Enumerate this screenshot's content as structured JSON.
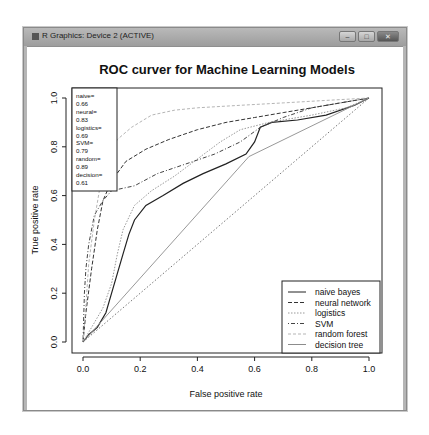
{
  "window": {
    "title": "R Graphics: Device 2 (ACTIVE)",
    "controls": {
      "minimize": "–",
      "maximize": "□",
      "close": "✕"
    }
  },
  "chart_data": {
    "type": "line",
    "title": "ROC curver for Machine Learning Models",
    "xlabel": "False positive rate",
    "ylabel": "True positive rate",
    "xlim": [
      0,
      1
    ],
    "ylim": [
      0,
      1
    ],
    "x_ticks": [
      "0.0",
      "0.2",
      "0.4",
      "0.6",
      "0.8",
      "1.0"
    ],
    "y_ticks": [
      "0.0",
      "0.2",
      "0.4",
      "0.6",
      "0.8",
      "1.0"
    ],
    "grid": false,
    "auc_box": {
      "lines": [
        "naive=",
        "0.66",
        "neural=",
        "0.83",
        "logistics=",
        "0.69",
        "SVM=",
        "0.79",
        "random=",
        "0.89",
        "decision=",
        "0.61"
      ]
    },
    "legend_position": "bottomright",
    "series": [
      {
        "name": "naive bayes",
        "auc": 0.66,
        "style": "solid",
        "color": "#222222",
        "width": 1.2,
        "points": [
          [
            0,
            0
          ],
          [
            0.02,
            0.03
          ],
          [
            0.05,
            0.06
          ],
          [
            0.08,
            0.12
          ],
          [
            0.1,
            0.2
          ],
          [
            0.12,
            0.28
          ],
          [
            0.14,
            0.36
          ],
          [
            0.16,
            0.44
          ],
          [
            0.18,
            0.5
          ],
          [
            0.22,
            0.56
          ],
          [
            0.28,
            0.6
          ],
          [
            0.35,
            0.65
          ],
          [
            0.42,
            0.69
          ],
          [
            0.5,
            0.73
          ],
          [
            0.57,
            0.77
          ],
          [
            0.6,
            0.82
          ],
          [
            0.62,
            0.88
          ],
          [
            0.66,
            0.9
          ],
          [
            0.75,
            0.91
          ],
          [
            0.85,
            0.93
          ],
          [
            0.95,
            0.97
          ],
          [
            1,
            1
          ]
        ]
      },
      {
        "name": "neural network",
        "auc": 0.83,
        "style": "dashed",
        "color": "#333333",
        "width": 1,
        "points": [
          [
            0,
            0
          ],
          [
            0.01,
            0.12
          ],
          [
            0.03,
            0.3
          ],
          [
            0.05,
            0.46
          ],
          [
            0.07,
            0.58
          ],
          [
            0.1,
            0.66
          ],
          [
            0.15,
            0.74
          ],
          [
            0.22,
            0.79
          ],
          [
            0.3,
            0.83
          ],
          [
            0.4,
            0.87
          ],
          [
            0.5,
            0.9
          ],
          [
            0.6,
            0.92
          ],
          [
            0.7,
            0.94
          ],
          [
            0.8,
            0.96
          ],
          [
            0.9,
            0.98
          ],
          [
            1,
            1
          ]
        ]
      },
      {
        "name": "logistics",
        "auc": 0.69,
        "style": "dotted",
        "color": "#999999",
        "width": 1,
        "points": [
          [
            0,
            0
          ],
          [
            0.03,
            0.06
          ],
          [
            0.07,
            0.14
          ],
          [
            0.1,
            0.24
          ],
          [
            0.12,
            0.36
          ],
          [
            0.14,
            0.46
          ],
          [
            0.18,
            0.56
          ],
          [
            0.24,
            0.62
          ],
          [
            0.32,
            0.68
          ],
          [
            0.4,
            0.75
          ],
          [
            0.48,
            0.82
          ],
          [
            0.55,
            0.87
          ],
          [
            0.65,
            0.9
          ],
          [
            0.8,
            0.93
          ],
          [
            0.92,
            0.96
          ],
          [
            1,
            1
          ]
        ]
      },
      {
        "name": "SVM",
        "auc": 0.79,
        "style": "dotdash",
        "color": "#444444",
        "width": 1,
        "points": [
          [
            0,
            0
          ],
          [
            0.005,
            0.2
          ],
          [
            0.01,
            0.3
          ],
          [
            0.02,
            0.4
          ],
          [
            0.04,
            0.52
          ],
          [
            0.07,
            0.58
          ],
          [
            0.1,
            0.62
          ],
          [
            0.18,
            0.64
          ],
          [
            0.26,
            0.69
          ],
          [
            0.36,
            0.73
          ],
          [
            0.46,
            0.77
          ],
          [
            0.55,
            0.82
          ],
          [
            0.62,
            0.88
          ],
          [
            0.7,
            0.92
          ],
          [
            0.8,
            0.96
          ],
          [
            0.9,
            0.98
          ],
          [
            1,
            1
          ]
        ]
      },
      {
        "name": "random forest",
        "auc": 0.89,
        "style": "dashed-light",
        "color": "#b5b5b5",
        "width": 1,
        "points": [
          [
            0,
            0
          ],
          [
            0.01,
            0.15
          ],
          [
            0.02,
            0.32
          ],
          [
            0.04,
            0.5
          ],
          [
            0.06,
            0.64
          ],
          [
            0.09,
            0.76
          ],
          [
            0.12,
            0.83
          ],
          [
            0.17,
            0.88
          ],
          [
            0.24,
            0.93
          ],
          [
            0.32,
            0.95
          ],
          [
            0.4,
            0.96
          ],
          [
            0.55,
            0.97
          ],
          [
            0.7,
            0.98
          ],
          [
            0.85,
            0.99
          ],
          [
            1,
            1
          ]
        ]
      },
      {
        "name": "decision tree",
        "auc": 0.61,
        "style": "solid-light",
        "color": "#8c8c8c",
        "width": 0.9,
        "points": [
          [
            0,
            0
          ],
          [
            0.58,
            0.76
          ],
          [
            1,
            1
          ]
        ]
      },
      {
        "name": "reference",
        "style": "dotted-diagonal",
        "color": "#555555",
        "width": 0.8,
        "points": [
          [
            0,
            0
          ],
          [
            1,
            1
          ]
        ]
      }
    ]
  }
}
